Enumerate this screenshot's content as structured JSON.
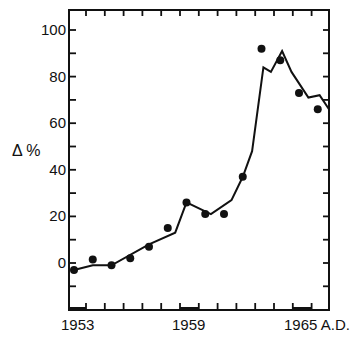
{
  "chart_data": {
    "type": "line",
    "title": "",
    "xlabel": "",
    "ylabel": "Δ %",
    "xlim": [
      1952.7,
      1966.0
    ],
    "ylim": [
      -20,
      108
    ],
    "x_tick_labels": [
      "1953",
      "1959",
      "1965 A.D."
    ],
    "x_ticks": [
      1953,
      1954,
      1955,
      1956,
      1957,
      1958,
      1959,
      1960,
      1961,
      1962,
      1963,
      1964,
      1965
    ],
    "y_tick_labels": [
      "0",
      "20",
      "40",
      "60",
      "80",
      "100"
    ],
    "y_ticks": [
      -10,
      0,
      10,
      20,
      30,
      40,
      50,
      60,
      70,
      80,
      90,
      100
    ],
    "grid": false,
    "legend": null,
    "series": [
      {
        "name": "observed",
        "style": "points",
        "x": [
          1953.2,
          1954.2,
          1955.2,
          1956.2,
          1957.2,
          1958.2,
          1959.2,
          1960.2,
          1961.2,
          1962.2,
          1963.2,
          1964.2,
          1965.2,
          1966.2
        ],
        "values": [
          -3,
          1.5,
          -1,
          2,
          7,
          15,
          26,
          21,
          21,
          37,
          92,
          87,
          73,
          66
        ]
      },
      {
        "name": "model",
        "style": "line",
        "x": [
          1953.2,
          1954.2,
          1955.2,
          1957.2,
          1958.6,
          1959.2,
          1960.5,
          1961.6,
          1962.2,
          1962.7,
          1963.3,
          1963.7,
          1964.3,
          1964.8,
          1965.7,
          1966.3,
          1966.8
        ],
        "values": [
          -3,
          -1,
          -1,
          8,
          13,
          26,
          21,
          27,
          37,
          48,
          84,
          82,
          91,
          82,
          71,
          72,
          66
        ]
      }
    ]
  }
}
